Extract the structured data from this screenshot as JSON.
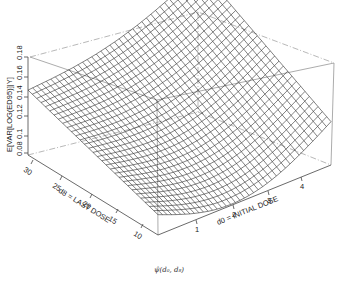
{
  "chart_data": {
    "type": "surface3d",
    "title": "",
    "caption": "ψ̂(d₀, d₈)",
    "zlabel": "E[VAR[LOG(ED95)]|Y]",
    "xlabel": "d0 = INITIAL DOSE",
    "ylabel": "d8 = LAST DOSE",
    "z_ticks": [
      "0.08",
      "0.1",
      "0.12",
      "0.14",
      "0.16",
      "0.18"
    ],
    "x_ticks": [
      "1",
      "2",
      "3",
      "4"
    ],
    "y_ticks": [
      "30",
      "25",
      "20",
      "15",
      "10"
    ],
    "zlim": [
      0.08,
      0.18
    ],
    "xlim": [
      0.2,
      4.8
    ],
    "ylim": [
      6,
      32
    ],
    "grid": false,
    "surface_description": "Wireframe mesh surface; highest (~0.16) at low d0 with high d8 corner, minimum (~0.085) near d0≈1, d8≈10, rising again toward high d0 (~0.11)",
    "corner_values": {
      "d0_min_d8_max": 0.128,
      "d0_min_d8_min": 0.095,
      "d0_max_d8_max": 0.165,
      "d0_max_d8_min": 0.112
    }
  },
  "labels": {
    "zlabel": "E[VAR[LOG(ED95)]|Y]",
    "xlabel": "d0 = INITIAL DOSE",
    "ylabel": "d8 = LAST DOSE",
    "caption": "ψ̂(d₀, d₈)"
  }
}
